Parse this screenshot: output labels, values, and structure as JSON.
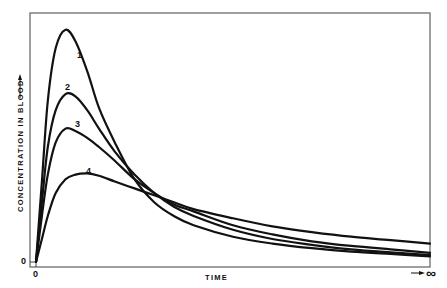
{
  "chart_data": {
    "type": "line",
    "title": "",
    "xlabel": "TIME",
    "ylabel": "CONCENTRATION IN BLOOD",
    "x_tick_labels": [
      "0"
    ],
    "y_tick_labels": [
      "0"
    ],
    "x_end_label": "∞",
    "xlim": [
      0,
      10
    ],
    "ylim": [
      0,
      10
    ],
    "grid": false,
    "legend": "none (curves labeled inline 1-4)",
    "x": [
      0,
      0.15,
      0.3,
      0.5,
      0.75,
      1.0,
      1.3,
      1.6,
      2.0,
      2.5,
      3.0,
      3.5,
      4.0,
      5.0,
      6.0,
      7.0,
      8.0,
      9.0,
      10.0
    ],
    "series": [
      {
        "name": "1",
        "values": [
          0,
          3.5,
          7.0,
          9.3,
          10.1,
          9.6,
          8.3,
          6.7,
          5.2,
          3.6,
          2.6,
          2.0,
          1.6,
          1.1,
          0.8,
          0.6,
          0.45,
          0.35,
          0.25
        ]
      },
      {
        "name": "2",
        "values": [
          0,
          2.6,
          5.0,
          6.6,
          7.3,
          7.2,
          6.6,
          5.8,
          4.8,
          3.8,
          3.0,
          2.4,
          2.0,
          1.4,
          1.0,
          0.75,
          0.55,
          0.42,
          0.3
        ]
      },
      {
        "name": "3",
        "values": [
          0,
          2.0,
          3.8,
          5.2,
          5.8,
          5.7,
          5.4,
          5.0,
          4.4,
          3.6,
          3.0,
          2.5,
          2.2,
          1.6,
          1.2,
          0.9,
          0.7,
          0.55,
          0.4
        ]
      },
      {
        "name": "4",
        "values": [
          0,
          1.0,
          2.0,
          3.0,
          3.6,
          3.8,
          3.85,
          3.75,
          3.5,
          3.2,
          2.9,
          2.6,
          2.3,
          1.9,
          1.55,
          1.3,
          1.1,
          0.95,
          0.8
        ]
      }
    ],
    "curve_labels": [
      {
        "text": "1",
        "near_series": "1"
      },
      {
        "text": "2",
        "near_series": "2"
      },
      {
        "text": "3",
        "near_series": "3"
      },
      {
        "text": "4",
        "near_series": "4"
      }
    ]
  }
}
